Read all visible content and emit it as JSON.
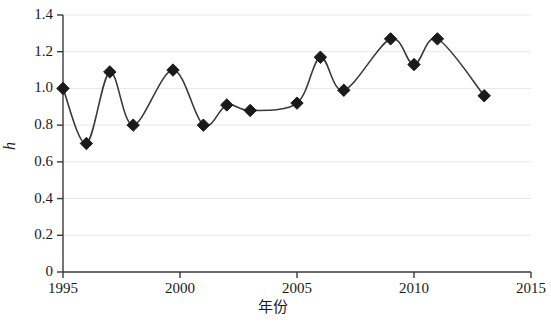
{
  "chart_data": {
    "type": "line",
    "title": "",
    "subtitle": "",
    "xlabel": "年份",
    "ylabel": "h",
    "xlim": [
      1995,
      2015
    ],
    "ylim": [
      0,
      1.4
    ],
    "xticks": [
      "1995",
      "2000",
      "2005",
      "2010",
      "2015"
    ],
    "xtick_values": [
      1995,
      2000,
      2005,
      2010,
      2015
    ],
    "yticks": [
      "0",
      "0.2",
      "0.4",
      "0.6",
      "0.8",
      "1.0",
      "1.2",
      "1.4"
    ],
    "ytick_values": [
      0,
      0.2,
      0.4,
      0.6,
      0.8,
      1.0,
      1.2,
      1.4
    ],
    "grid": "horizontal",
    "legend": "none",
    "marker": "diamond",
    "marker_color": "#1a1a1a",
    "line_color": "#3a3a3a",
    "smoothing": "spline",
    "x": [
      1995,
      1996,
      1997,
      1998,
      1999.7,
      2001,
      2002,
      2003,
      2005,
      2006,
      2007,
      2009,
      2010,
      2011,
      2013
    ],
    "values": [
      1.0,
      0.7,
      1.09,
      0.8,
      1.1,
      0.8,
      0.91,
      0.88,
      0.92,
      1.17,
      0.99,
      1.27,
      1.13,
      1.27,
      0.96
    ],
    "series": [
      {
        "name": "h",
        "points": [
          {
            "x": 1995,
            "y": 1.0
          },
          {
            "x": 1996,
            "y": 0.7
          },
          {
            "x": 1997,
            "y": 1.09
          },
          {
            "x": 1998,
            "y": 0.8
          },
          {
            "x": 1999.7,
            "y": 1.1
          },
          {
            "x": 2001,
            "y": 0.8
          },
          {
            "x": 2002,
            "y": 0.91
          },
          {
            "x": 2003,
            "y": 0.88
          },
          {
            "x": 2005,
            "y": 0.92
          },
          {
            "x": 2006,
            "y": 1.17
          },
          {
            "x": 2007,
            "y": 0.99
          },
          {
            "x": 2009,
            "y": 1.27
          },
          {
            "x": 2010,
            "y": 1.13
          },
          {
            "x": 2011,
            "y": 1.27
          },
          {
            "x": 2013,
            "y": 0.96
          }
        ]
      }
    ]
  }
}
